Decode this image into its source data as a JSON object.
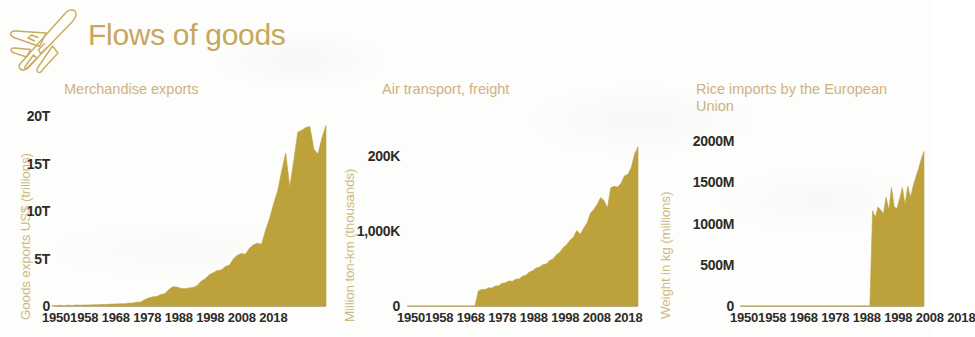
{
  "header": {
    "title": "Flows of goods",
    "icon": "airplane-icon",
    "title_color": "#c6a75c"
  },
  "theme": {
    "background": "#fdfdfb",
    "series_fill": "#bda23c",
    "title_gold": "#c6a75c",
    "subtitle_gold": "#cdb281",
    "axis_label_gold": "#cdb97f",
    "tick_text": "#2e2b28",
    "baseline": "#b9b2a4"
  },
  "charts": [
    {
      "id": "merchandise-exports",
      "title": "Merchandise exports",
      "ylabel": "Goods exports US$ (trillions)",
      "yticks": [
        "0",
        "5T",
        "10T",
        "15T",
        "20T"
      ],
      "xticks_text": "19501958 1968 1978 1988 1998 2008 2018"
    },
    {
      "id": "air-transport-freight",
      "title": "Air transport, freight",
      "ylabel": "Million ton-km (thousands)",
      "yticks": [
        "0",
        "1,000K",
        "200K"
      ],
      "xticks_text": "19501958 1968 1978 1988 1998 2008 2018"
    },
    {
      "id": "rice-imports-eu",
      "title": "Rice imports by the European\nUnion",
      "ylabel": "Weight in kg (millions)",
      "yticks": [
        "0",
        "500M",
        "1000M",
        "1500M",
        "2000M"
      ],
      "xticks_text": "19501958 1968 1978 1988 1998 2008 2018"
    }
  ],
  "chart_data": [
    {
      "type": "area",
      "title": "Merchandise exports",
      "xlabel": "",
      "ylabel": "Goods exports US$ (trillions)",
      "xlim": [
        1950,
        2018
      ],
      "ylim": [
        0,
        20
      ],
      "grid": false,
      "legend": "none",
      "tick_labels_y": [
        "0",
        "5T",
        "10T",
        "15T",
        "20T"
      ],
      "tick_values_y": [
        0,
        5,
        10,
        15,
        20
      ],
      "tick_labels_x": [
        "1950",
        "1958",
        "1968",
        "1978",
        "1988",
        "1998",
        "2008",
        "2018"
      ],
      "tick_values_x": [
        1950,
        1958,
        1968,
        1978,
        1988,
        1998,
        2008,
        2018
      ],
      "x": [
        1950,
        1952,
        1954,
        1956,
        1958,
        1960,
        1962,
        1964,
        1966,
        1968,
        1970,
        1972,
        1974,
        1976,
        1978,
        1980,
        1981,
        1982,
        1983,
        1984,
        1985,
        1986,
        1988,
        1990,
        1992,
        1994,
        1996,
        1998,
        2000,
        2002,
        2004,
        2006,
        2008,
        2009,
        2010,
        2011,
        2012,
        2013,
        2014,
        2015,
        2016,
        2017,
        2018
      ],
      "values": [
        0.06,
        0.08,
        0.09,
        0.11,
        0.11,
        0.13,
        0.15,
        0.18,
        0.21,
        0.24,
        0.31,
        0.41,
        0.84,
        0.99,
        1.3,
        2.03,
        2.0,
        1.85,
        1.82,
        1.9,
        1.95,
        2.14,
        2.86,
        3.49,
        3.78,
        4.3,
        5.35,
        5.45,
        6.45,
        6.5,
        9.2,
        12.1,
        16.1,
        12.5,
        15.3,
        18.3,
        18.5,
        18.8,
        18.9,
        16.5,
        16.0,
        17.7,
        19.0
      ]
    },
    {
      "type": "area",
      "title": "Air transport, freight",
      "xlabel": "",
      "ylabel": "Million ton-km (thousands)",
      "xlim": [
        1950,
        2018
      ],
      "ylim": [
        0,
        230
      ],
      "grid": false,
      "legend": "none",
      "tick_labels_y": [
        "0",
        "1,000K",
        "200K"
      ],
      "tick_values_y": [
        0,
        100,
        200
      ],
      "tick_labels_x": [
        "1950",
        "1958",
        "1968",
        "1978",
        "1988",
        "1998",
        "2008",
        "2018"
      ],
      "tick_values_x": [
        1950,
        1958,
        1968,
        1978,
        1988,
        1998,
        2008,
        2018
      ],
      "x": [
        1950,
        1958,
        1965,
        1970,
        1971,
        1973,
        1975,
        1977,
        1979,
        1981,
        1983,
        1985,
        1987,
        1989,
        1991,
        1993,
        1995,
        1997,
        1999,
        2000,
        2001,
        2002,
        2003,
        2004,
        2005,
        2006,
        2007,
        2008,
        2009,
        2010,
        2011,
        2012,
        2013,
        2014,
        2015,
        2016,
        2017,
        2018
      ],
      "values": [
        0,
        0,
        0,
        0,
        20,
        22,
        24,
        27,
        31,
        33,
        36,
        41,
        47,
        52,
        56,
        63,
        72,
        82,
        92,
        101,
        96,
        104,
        111,
        124,
        129,
        136,
        145,
        141,
        131,
        158,
        160,
        159,
        164,
        174,
        176,
        185,
        203,
        213
      ]
    },
    {
      "type": "area",
      "title": "Rice imports by the European Union",
      "xlabel": "",
      "ylabel": "Weight in kg (millions)",
      "xlim": [
        1950,
        2018
      ],
      "ylim": [
        0,
        2200
      ],
      "grid": false,
      "legend": "none",
      "tick_labels_y": [
        "0",
        "500M",
        "1000M",
        "1500M",
        "2000M"
      ],
      "tick_values_y": [
        0,
        500,
        1000,
        1500,
        2000
      ],
      "tick_labels_x": [
        "1950",
        "1958",
        "1968",
        "1978",
        "1988",
        "1998",
        "2008",
        "2018"
      ],
      "tick_values_x": [
        1950,
        1958,
        1968,
        1978,
        1988,
        1998,
        2008,
        2018
      ],
      "x": [
        1950,
        1998,
        1999,
        2000,
        2001,
        2002,
        2003,
        2004,
        2005,
        2006,
        2007,
        2008,
        2009,
        2010,
        2011,
        2012,
        2013,
        2014,
        2015,
        2016,
        2017,
        2018
      ],
      "values": [
        0,
        0,
        1270,
        1180,
        1320,
        1280,
        1230,
        1450,
        1280,
        1580,
        1320,
        1300,
        1430,
        1580,
        1350,
        1600,
        1450,
        1600,
        1720,
        1830,
        1960,
        2060
      ]
    }
  ]
}
